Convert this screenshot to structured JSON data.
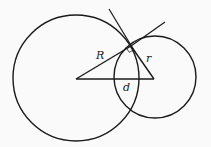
{
  "diagram": {
    "labels": {
      "big_radius": "R",
      "small_radius": "r",
      "center_distance": "d"
    },
    "colors": {
      "stroke": "#1a1a1a",
      "background": "#fafafa"
    }
  }
}
